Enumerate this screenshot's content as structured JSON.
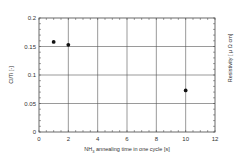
{
  "chart_data": {
    "type": "scatter",
    "title": "",
    "xlabel": "NH3 annealing time in one cycle [s]",
    "xlabel_parts": {
      "pre": "NH",
      "sub": "3",
      "post": " annealing time in one cycle [s]"
    },
    "ylabel": "Cl/Ti [-]",
    "ylabel_right": "Resistivity [ μ Ω cm]",
    "xlim": [
      0,
      12
    ],
    "ylim": [
      0,
      0.2
    ],
    "xticks": [
      "0",
      "2",
      "4",
      "6",
      "8",
      "10",
      "12"
    ],
    "yticks": [
      "0",
      "0.05",
      "0.1",
      "0.15",
      "0.2"
    ],
    "grid": true,
    "legend": null,
    "series": [
      {
        "name": "Cl/Ti",
        "marker": "circle-filled",
        "color": "#111111",
        "x": [
          1,
          2,
          10
        ],
        "y": [
          0.158,
          0.153,
          0.073
        ]
      }
    ]
  }
}
